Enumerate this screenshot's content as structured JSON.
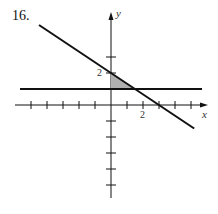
{
  "problem_number": "16.",
  "diagram": {
    "x_axis_label": "x",
    "y_axis_label": "y",
    "x_tick_label": "2",
    "y_tick_label": "2",
    "x_range": [
      -6,
      6
    ],
    "y_range": [
      -6,
      4
    ],
    "lines": [
      {
        "name": "diagonal-line",
        "equation": "y = 2 - (2/3)x",
        "x_from": -4.5,
        "x_to": 5.2
      },
      {
        "name": "horizontal-line",
        "equation": "y = 1",
        "x_from": -5,
        "x_to": 5
      }
    ],
    "shaded_region": {
      "vertices": [
        [
          0,
          2
        ],
        [
          0,
          1
        ],
        [
          1.5,
          1
        ]
      ],
      "color": "#b0b0b0"
    },
    "line_color": "#111111"
  }
}
